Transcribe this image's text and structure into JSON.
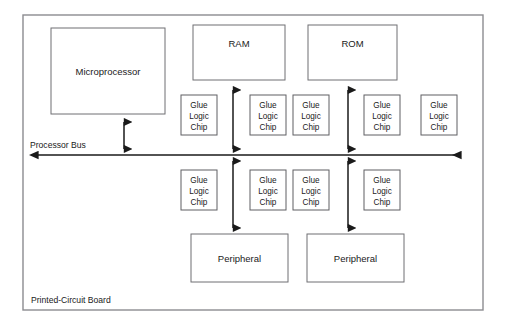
{
  "diagram": {
    "board": {
      "label": "Printed-Circuit Board",
      "outline_color": "#8c8c90"
    },
    "bus": {
      "label": "Processor Bus",
      "color": "#1a1a1a"
    },
    "units": [
      {
        "id": "microprocessor",
        "label": "Microprocessor",
        "x": 51,
        "y": 28,
        "w": 114,
        "h": 86
      },
      {
        "id": "ram",
        "label": "RAM",
        "x": 193,
        "y": 25,
        "w": 92,
        "h": 55
      },
      {
        "id": "rom",
        "label": "ROM",
        "x": 308,
        "y": 25,
        "w": 89,
        "h": 55
      },
      {
        "id": "peripheral-left",
        "label": "Peripheral",
        "x": 191,
        "y": 234,
        "w": 97,
        "h": 48
      },
      {
        "id": "peripheral-right",
        "label": "Peripheral",
        "x": 307,
        "y": 234,
        "w": 97,
        "h": 48
      }
    ],
    "glue_chip_label_lines": [
      "Glue",
      "Logic",
      "Chip"
    ],
    "glue_chips_top": [
      {
        "id": "glue-top-1",
        "x": 181,
        "y": 95,
        "w": 36,
        "h": 40
      },
      {
        "id": "glue-top-2",
        "x": 250,
        "y": 95,
        "w": 36,
        "h": 40
      },
      {
        "id": "glue-top-3",
        "x": 293,
        "y": 95,
        "w": 36,
        "h": 40
      },
      {
        "id": "glue-top-4",
        "x": 364,
        "y": 95,
        "w": 36,
        "h": 40
      },
      {
        "id": "glue-top-5",
        "x": 421,
        "y": 95,
        "w": 36,
        "h": 40
      }
    ],
    "glue_chips_bottom": [
      {
        "id": "glue-bottom-1",
        "x": 181,
        "y": 170,
        "w": 36,
        "h": 40
      },
      {
        "id": "glue-bottom-2",
        "x": 250,
        "y": 170,
        "w": 36,
        "h": 40
      },
      {
        "id": "glue-bottom-3",
        "x": 293,
        "y": 170,
        "w": 36,
        "h": 40
      },
      {
        "id": "glue-bottom-4",
        "x": 364,
        "y": 170,
        "w": 36,
        "h": 40
      }
    ],
    "connectors": [
      {
        "id": "cpu-to-bus",
        "note": "double-headed vertical arrow"
      },
      {
        "id": "ram-to-bus",
        "note": "double-headed vertical arrow"
      },
      {
        "id": "rom-to-bus",
        "note": "double-headed vertical arrow"
      },
      {
        "id": "bus-to-peripheral-left",
        "note": "double-headed vertical arrow"
      },
      {
        "id": "bus-to-peripheral-right",
        "note": "double-headed vertical arrow"
      }
    ]
  }
}
